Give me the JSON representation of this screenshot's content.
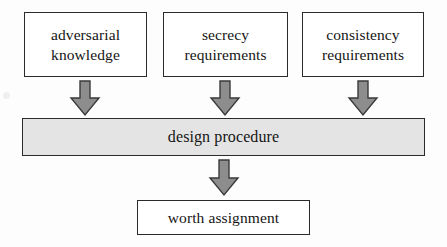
{
  "diagram": {
    "type": "flowchart",
    "colors": {
      "background": "#fdfdfd",
      "box_fill": "#ffffff",
      "box_border": "#2b2b2b",
      "bar_fill": "#e4e4e4",
      "arrow_fill": "#8d8d8d",
      "arrow_stroke": "#3a3a3a",
      "text": "#151515"
    },
    "inputs": [
      {
        "id": "adversarial-knowledge",
        "line1": "adversarial",
        "line2": "knowledge"
      },
      {
        "id": "secrecy-requirements",
        "line1": "secrecy",
        "line2": "requirements"
      },
      {
        "id": "consistency-requirements",
        "line1": "consistency",
        "line2": "requirements"
      }
    ],
    "process": {
      "id": "design-procedure",
      "label": "design procedure"
    },
    "output": {
      "id": "worth-assignment",
      "label": "worth assignment"
    },
    "arrows": [
      {
        "id": "arrow-adversarial-to-process",
        "direction": "down"
      },
      {
        "id": "arrow-secrecy-to-process",
        "direction": "down"
      },
      {
        "id": "arrow-consistency-to-process",
        "direction": "down"
      },
      {
        "id": "arrow-process-to-output",
        "direction": "down"
      }
    ]
  }
}
